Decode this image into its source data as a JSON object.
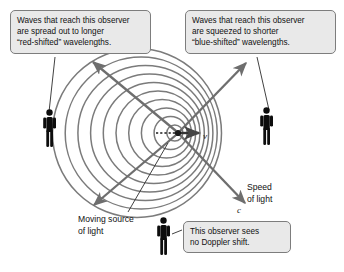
{
  "figure": {
    "background_color": "#ffffff"
  },
  "callouts": [
    {
      "id": "red-shift",
      "name": "callout-red-shift",
      "lines": [
        "Waves that reach this observer",
        "are spread out to longer",
        "“red-shifted” wavelengths."
      ],
      "fill_color": "#e9e9e9",
      "border_color": "#7d7d7d"
    },
    {
      "id": "blue-shift",
      "name": "callout-blue-shift",
      "lines": [
        "Waves that reach this observer",
        "are squeezed to shorter",
        "“blue-shifted” wavelengths."
      ],
      "fill_color": "#e9e9e9",
      "border_color": "#7d7d7d"
    },
    {
      "id": "no-shift",
      "name": "callout-no-doppler-shift",
      "lines": [
        "This observer sees",
        "no Doppler shift."
      ],
      "fill_color": "#e9e9e9",
      "border_color": "#7d7d7d"
    }
  ],
  "labels": {
    "speed_of_light": {
      "lines": [
        "Speed",
        "of light"
      ]
    },
    "moving_source": {
      "lines": [
        "Moving source",
        "of light"
      ]
    }
  },
  "symbols": {
    "velocity": "v",
    "light_speed": "c"
  },
  "diagram": {
    "wavefront_color": "#777777",
    "arrow_color": "#6e6e6e",
    "figure_color": "#0d0d0d",
    "leader_color": "#3a3a3a",
    "source_center": {
      "x": 178,
      "y": 133
    },
    "wavefronts": {
      "count": 10,
      "description": "concentric circles offset left of source; compressed ahead of motion, spread out behind"
    },
    "observers": [
      {
        "name": "observer-left",
        "x": 50,
        "y": 130,
        "shift": "red-shifted"
      },
      {
        "name": "observer-right",
        "x": 266,
        "y": 128,
        "shift": "blue-shifted"
      },
      {
        "name": "observer-bottom",
        "x": 163,
        "y": 238,
        "shift": "none"
      }
    ],
    "light_rays": [
      {
        "name": "ray-upper-left",
        "direction": "up-left"
      },
      {
        "name": "ray-upper-right",
        "direction": "up-right"
      },
      {
        "name": "ray-lower-left",
        "direction": "down-left"
      },
      {
        "name": "ray-lower-right",
        "direction": "down-right"
      }
    ],
    "velocity_arrow": {
      "name": "source-velocity-arrow",
      "direction": "right"
    }
  }
}
